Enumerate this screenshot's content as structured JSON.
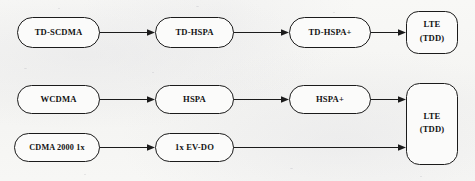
{
  "diagram": {
    "background_color": "#f6f6f4",
    "line_color": "#1b1b1b",
    "node_fill": "#fbfbfa",
    "rows": [
      {
        "id": "tdd-path",
        "name": "TD-SCDMA evolution path",
        "nodes": [
          {
            "id": "td-scdma",
            "label": "TD-SCDMA"
          },
          {
            "id": "td-hspa",
            "label": "TD-HSPA"
          },
          {
            "id": "td-hspa-plus",
            "label": "TD-HSPA+"
          },
          {
            "id": "lte-tdd-top",
            "label_line1": "LTE",
            "label_line2": "(TDD)"
          }
        ]
      },
      {
        "id": "wcdma-path",
        "name": "WCDMA evolution path",
        "nodes": [
          {
            "id": "wcdma",
            "label": "WCDMA"
          },
          {
            "id": "hspa",
            "label": "HSPA"
          },
          {
            "id": "hspa-plus",
            "label": "HSPA+"
          }
        ]
      },
      {
        "id": "cdma2000-path",
        "name": "CDMA2000 evolution path",
        "nodes": [
          {
            "id": "cdma2000-1x",
            "label": "CDMA 2000  1x"
          },
          {
            "id": "1x-ev-do",
            "label": "1x EV-DO"
          }
        ]
      }
    ],
    "merged_node": {
      "id": "lte-tdd-merged",
      "label_line1": "LTE",
      "label_line2": "(TDD)"
    },
    "edges": [
      {
        "id": "e1",
        "from": "td-scdma",
        "to": "td-hspa"
      },
      {
        "id": "e2",
        "from": "td-hspa",
        "to": "td-hspa-plus"
      },
      {
        "id": "e3",
        "from": "td-hspa-plus",
        "to": "lte-tdd-top"
      },
      {
        "id": "e4",
        "from": "wcdma",
        "to": "hspa"
      },
      {
        "id": "e5",
        "from": "hspa",
        "to": "hspa-plus"
      },
      {
        "id": "e6",
        "from": "hspa-plus",
        "to": "lte-tdd-merged"
      },
      {
        "id": "e7",
        "from": "cdma2000-1x",
        "to": "1x-ev-do"
      },
      {
        "id": "e8",
        "from": "1x-ev-do",
        "to": "lte-tdd-merged"
      }
    ]
  }
}
